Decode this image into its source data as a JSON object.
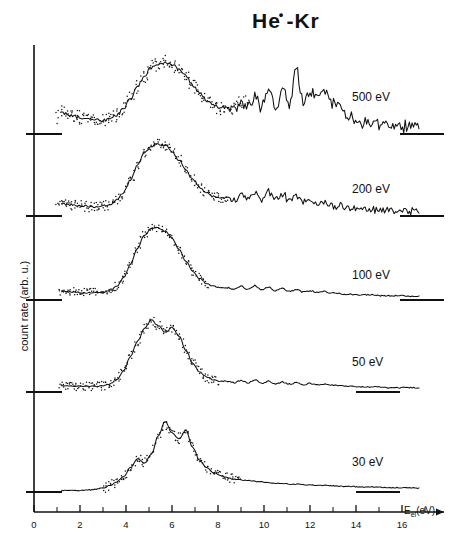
{
  "figure": {
    "title_main": "He",
    "title_sup": "•",
    "title_rest": "-Kr",
    "title_full": "He*-Kr"
  },
  "axes": {
    "xlabel_symbol": "E",
    "xlabel_sub": "el",
    "xlabel_unit": "(eV)",
    "ylabel": "count rate (arb. u.)",
    "x_ticks": [
      "0",
      "2",
      "4",
      "6",
      "8",
      "10",
      "12",
      "14",
      "16"
    ],
    "x_tick_values": [
      0,
      2,
      4,
      6,
      8,
      10,
      12,
      14,
      16
    ],
    "x_minor_step": 1,
    "xlim": [
      0,
      17.6
    ],
    "grid": false,
    "frame": "left-and-bottom-axes-with-arrow"
  },
  "traces": [
    {
      "label": "500 eV",
      "energy_eV": 500
    },
    {
      "label": "200 eV",
      "energy_eV": 200
    },
    {
      "label": "100 eV",
      "energy_eV": 100
    },
    {
      "label": "50 eV",
      "energy_eV": 50
    },
    {
      "label": "30 eV",
      "energy_eV": 30
    }
  ],
  "chart_data": {
    "type": "line",
    "xlabel": "E_el (eV)",
    "ylabel": "count rate (arb. u.)",
    "xlim": [
      0,
      17.6
    ],
    "grid": false,
    "legend": "inline-right-of-each-trace",
    "x": [
      1.2,
      1.5,
      1.8,
      2.1,
      2.4,
      2.7,
      3.0,
      3.3,
      3.6,
      3.9,
      4.2,
      4.5,
      4.8,
      5.1,
      5.4,
      5.7,
      6.0,
      6.3,
      6.6,
      6.9,
      7.2,
      7.5,
      7.8,
      8.1,
      8.4,
      8.7,
      9.0,
      9.3,
      9.6,
      9.9,
      10.2,
      10.5,
      10.8,
      11.1,
      11.4,
      11.7,
      12.0,
      12.3,
      12.6,
      12.9,
      13.2,
      13.5,
      13.8,
      14.1,
      14.4,
      14.7,
      15.0,
      15.3,
      15.6,
      15.9,
      16.2,
      16.5,
      16.8
    ],
    "series": [
      {
        "name": "500 eV",
        "baseline_y_px": 134,
        "values": [
          0.3,
          0.27,
          0.24,
          0.22,
          0.2,
          0.19,
          0.19,
          0.21,
          0.26,
          0.36,
          0.5,
          0.66,
          0.81,
          0.92,
          0.98,
          1.0,
          0.97,
          0.9,
          0.8,
          0.68,
          0.57,
          0.47,
          0.4,
          0.36,
          0.38,
          0.33,
          0.47,
          0.4,
          0.52,
          0.38,
          0.58,
          0.36,
          0.62,
          0.42,
          0.88,
          0.46,
          0.6,
          0.52,
          0.58,
          0.45,
          0.38,
          0.3,
          0.24,
          0.19,
          0.16,
          0.14,
          0.13,
          0.12,
          0.12,
          0.11,
          0.11,
          0.11,
          0.1
        ],
        "peak_eV": 5.9,
        "note": "broad peak near 6 eV plus strong structured spikes between 9 and 14 eV"
      },
      {
        "name": "200 eV",
        "baseline_y_px": 216,
        "values": [
          0.17,
          0.16,
          0.15,
          0.14,
          0.13,
          0.13,
          0.14,
          0.16,
          0.22,
          0.33,
          0.5,
          0.7,
          0.87,
          0.97,
          1.0,
          0.98,
          0.9,
          0.78,
          0.64,
          0.51,
          0.4,
          0.32,
          0.27,
          0.24,
          0.26,
          0.22,
          0.3,
          0.24,
          0.33,
          0.23,
          0.34,
          0.22,
          0.31,
          0.21,
          0.26,
          0.19,
          0.22,
          0.18,
          0.19,
          0.16,
          0.14,
          0.12,
          0.11,
          0.1,
          0.09,
          0.09,
          0.08,
          0.08,
          0.08,
          0.08,
          0.07,
          0.07,
          0.07
        ],
        "peak_eV": 5.7,
        "note": "sharp symmetric main peak, weaker high-energy structure"
      },
      {
        "name": "100 eV",
        "baseline_y_px": 300,
        "values": [
          0.12,
          0.11,
          0.11,
          0.1,
          0.1,
          0.1,
          0.11,
          0.13,
          0.19,
          0.31,
          0.5,
          0.72,
          0.9,
          0.99,
          1.0,
          0.96,
          0.86,
          0.7,
          0.54,
          0.4,
          0.3,
          0.23,
          0.19,
          0.17,
          0.17,
          0.15,
          0.19,
          0.15,
          0.2,
          0.14,
          0.18,
          0.13,
          0.16,
          0.12,
          0.14,
          0.11,
          0.13,
          0.11,
          0.12,
          0.1,
          0.09,
          0.08,
          0.08,
          0.07,
          0.07,
          0.07,
          0.06,
          0.06,
          0.06,
          0.06,
          0.06,
          0.05,
          0.05
        ],
        "peak_eV": 5.8,
        "note": "narrow intense peak, low tail"
      },
      {
        "name": "50 eV",
        "baseline_y_px": 392,
        "values": [
          0.09,
          0.08,
          0.08,
          0.08,
          0.08,
          0.08,
          0.09,
          0.11,
          0.17,
          0.3,
          0.5,
          0.7,
          0.88,
          1.0,
          0.92,
          0.83,
          0.9,
          0.78,
          0.58,
          0.4,
          0.28,
          0.21,
          0.17,
          0.15,
          0.15,
          0.13,
          0.16,
          0.13,
          0.17,
          0.12,
          0.15,
          0.11,
          0.14,
          0.11,
          0.13,
          0.1,
          0.12,
          0.1,
          0.11,
          0.1,
          0.09,
          0.08,
          0.08,
          0.07,
          0.07,
          0.07,
          0.07,
          0.06,
          0.06,
          0.06,
          0.06,
          0.06,
          0.05
        ],
        "peak_eV": 5.7,
        "secondary_peak_eV": 6.5,
        "note": "resolved doublet structure at the main band"
      },
      {
        "name": "30 eV",
        "baseline_y_px": 492,
        "values": [
          0.02,
          0.02,
          0.02,
          0.02,
          0.03,
          0.04,
          0.06,
          0.09,
          0.14,
          0.22,
          0.34,
          0.46,
          0.4,
          0.52,
          0.78,
          0.98,
          0.82,
          0.74,
          0.86,
          0.62,
          0.44,
          0.34,
          0.27,
          0.23,
          0.2,
          0.18,
          0.17,
          0.16,
          0.15,
          0.14,
          0.13,
          0.12,
          0.12,
          0.11,
          0.11,
          0.1,
          0.1,
          0.09,
          0.09,
          0.09,
          0.08,
          0.08,
          0.08,
          0.07,
          0.07,
          0.07,
          0.07,
          0.06,
          0.06,
          0.06,
          0.06,
          0.06,
          0.05
        ],
        "peak_eV": 5.8,
        "shoulder_eV": 4.9,
        "secondary_peak_eV": 6.6,
        "note": "three resolved features: shoulder near 5 eV, main peak 5.8 eV, secondary 6.6 eV"
      }
    ]
  },
  "colors": {
    "ink": "#111111",
    "background": "#ffffff"
  }
}
